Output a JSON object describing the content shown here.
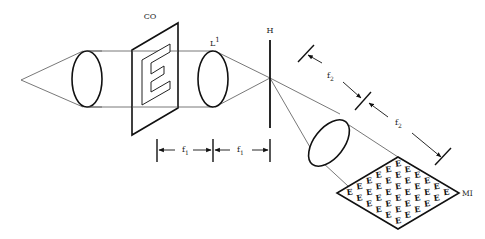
{
  "diagram": {
    "labels": {
      "object": "CO",
      "lens1": "L",
      "lens1_sup": "1",
      "hologram": "H",
      "image_array": "MI",
      "f1_a": "f",
      "f1_a_sub": "1",
      "f1_b": "f",
      "f1_b_sub": "1",
      "f2_a": "f",
      "f2_a_sub": "2",
      "f2_b": "f",
      "f2_b_sub": "2"
    },
    "object_glyph": "E",
    "colors": {
      "stroke": "#111111",
      "ray": "#555555",
      "background": "#ffffff"
    }
  }
}
